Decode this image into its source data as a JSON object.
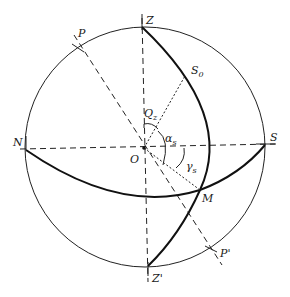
{
  "diagram": {
    "labels": {
      "zenith": "Z",
      "nadir": "Z'",
      "pole": "P",
      "pole_opposite": "P'",
      "north": "N",
      "south": "S",
      "center": "O",
      "sun_noon": "S",
      "sun_noon_sub": "0",
      "point_m": "M",
      "angle_q": "Q",
      "angle_q_sub": "z",
      "angle_alpha": "α",
      "angle_alpha_sub": "s",
      "angle_gamma": "γ",
      "angle_gamma_sub": "s"
    },
    "colors": {
      "stroke": "#111111",
      "background": "#ffffff"
    }
  }
}
